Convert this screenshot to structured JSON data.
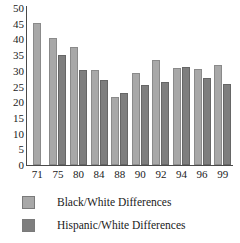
{
  "chart_data": {
    "type": "bar",
    "title": "",
    "xlabel": "",
    "ylabel": "",
    "ylim": [
      0,
      50
    ],
    "ytick_step": 5,
    "yticks": [
      50,
      45,
      40,
      35,
      30,
      25,
      20,
      15,
      10,
      5,
      0
    ],
    "grid": false,
    "legend_position": "bottom-left",
    "categories": [
      "71",
      "75",
      "80",
      "84",
      "88",
      "90",
      "92",
      "94",
      "96",
      "99"
    ],
    "series": [
      {
        "name": "Black/White Differences",
        "color": "#a8a8a8",
        "values": [
          45.2,
          40.4,
          37.6,
          30.3,
          21.6,
          29.2,
          33.5,
          30.8,
          30.5,
          32.0
        ]
      },
      {
        "name": "Hispanic/White Differences",
        "color": "#7e7e7e",
        "values": [
          null,
          35.0,
          30.2,
          27.2,
          22.9,
          25.4,
          26.3,
          31.1,
          27.8,
          25.8
        ]
      }
    ]
  },
  "legend": {
    "items": [
      {
        "label": "Black/White Differences",
        "swatch": "legend-swatch-black-white"
      },
      {
        "label": "Hispanic/White Differences",
        "swatch": "legend-swatch-hispanic-white"
      }
    ]
  }
}
